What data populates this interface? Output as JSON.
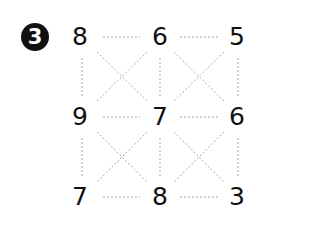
{
  "badge": {
    "label": "3"
  },
  "grid": {
    "rows": [
      [
        "8",
        "6",
        "5"
      ],
      [
        "9",
        "7",
        "6"
      ],
      [
        "7",
        "8",
        "3"
      ]
    ]
  },
  "colors": {
    "text": "#111111",
    "dashes": "#aaaaaa",
    "badge_bg": "#111111"
  }
}
